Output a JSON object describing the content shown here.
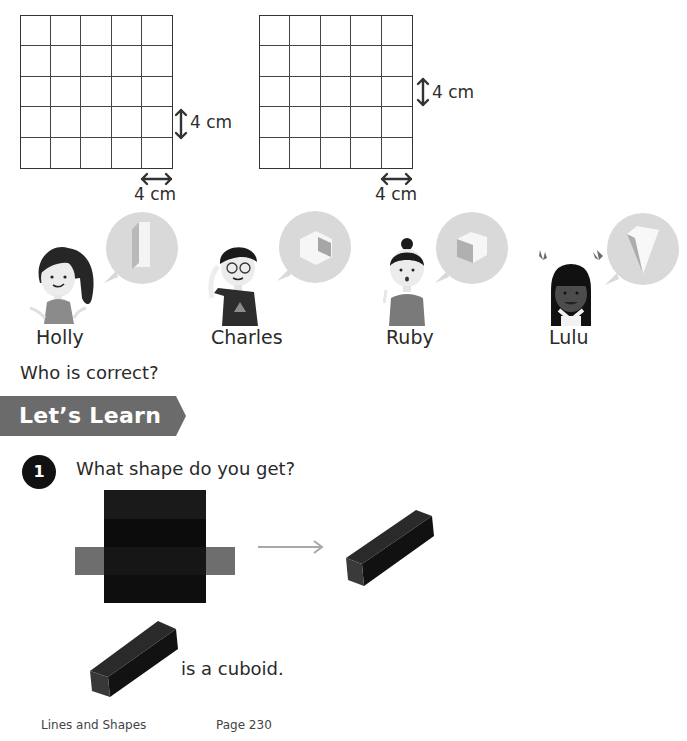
{
  "grids": [
    {
      "rows": 5,
      "cols": 5,
      "vertical_label": "4 cm",
      "horizontal_label": "4 cm"
    },
    {
      "rows": 5,
      "cols": 5,
      "vertical_label": "4 cm",
      "horizontal_label": "4 cm"
    }
  ],
  "characters": [
    {
      "name": "Holly",
      "bubble_shape": "tall-cuboid"
    },
    {
      "name": "Charles",
      "bubble_shape": "cube-hexagon"
    },
    {
      "name": "Ruby",
      "bubble_shape": "cube"
    },
    {
      "name": "Lulu",
      "bubble_shape": "pyramid"
    }
  ],
  "question": "Who is correct?",
  "section": {
    "title": "Let’s Learn",
    "color": "#6b6b6b"
  },
  "task": {
    "number": "1",
    "prompt": "What shape do you get?",
    "conclusion": "is a cuboid."
  },
  "colors": {
    "net_dark": "#161616",
    "net_dark_band": "#0c0c0c",
    "net_side": "#6e6e6e",
    "arrow": "#a8a8a8",
    "bubble": "#d9d9d9"
  },
  "footer": {
    "chapter": "Lines and Shapes",
    "page": "Page 230"
  }
}
